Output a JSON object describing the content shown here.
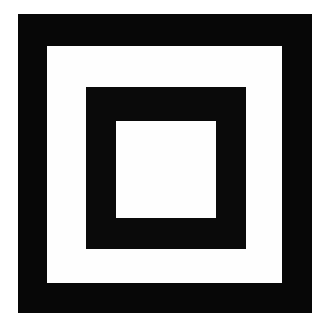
{
  "figure": {
    "canvas": {
      "width_px": 330,
      "height_px": 336,
      "background_color": "#ffffff"
    },
    "colors": {
      "foreground": "#070707",
      "background": "#ffffff",
      "gap": "#fefefe"
    },
    "layers": [
      {
        "name": "outer-black-frame",
        "fill": "#070707",
        "left_px": 18,
        "top_px": 14,
        "width_px": 294,
        "height_px": 299,
        "band_thickness_px": 30
      },
      {
        "name": "outer-white-gap",
        "fill": "#fefefe",
        "left_px": 47,
        "top_px": 46,
        "width_px": 235,
        "height_px": 237,
        "band_thickness_px": 39
      },
      {
        "name": "middle-black-frame",
        "fill": "#0a0a0a",
        "left_px": 86,
        "top_px": 87,
        "width_px": 160,
        "height_px": 162,
        "band_thickness_px": 30
      },
      {
        "name": "inner-white-square",
        "fill": "#fefefe",
        "left_px": 116,
        "top_px": 121,
        "width_px": 100,
        "height_px": 97,
        "band_thickness_px": 0
      }
    ],
    "ring_count": 4,
    "symmetry": "concentric square"
  }
}
